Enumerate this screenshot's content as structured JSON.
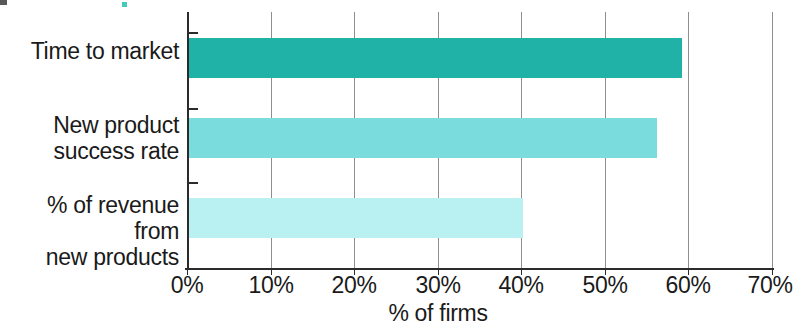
{
  "chart_data": {
    "type": "bar",
    "orientation": "horizontal",
    "title": "",
    "xlabel": "% of firms",
    "ylabel": "",
    "categories": [
      "Time to market",
      "New product\nsuccess rate",
      "% of revenue from\nnew products"
    ],
    "values": [
      59,
      56,
      40
    ],
    "xlim": [
      0,
      70
    ],
    "xticks": [
      0,
      10,
      20,
      30,
      40,
      50,
      60,
      70
    ],
    "xticklabels": [
      "0%",
      "10%",
      "20%",
      "30%",
      "40%",
      "50%",
      "60%",
      "70%"
    ],
    "grid": "vertical",
    "legend": "none",
    "bar_colors": [
      "#20b2a6",
      "#7adcdc",
      "#b9f0f2"
    ]
  },
  "axis": {
    "x_title": "% of firms",
    "tick_0": "0%",
    "tick_1": "10%",
    "tick_2": "20%",
    "tick_3": "30%",
    "tick_4": "40%",
    "tick_5": "50%",
    "tick_6": "60%",
    "tick_7": "70%"
  },
  "categories": {
    "cat_0": "Time to market",
    "cat_1": "New product\nsuccess rate",
    "cat_2": "% of revenue from\nnew products"
  },
  "colors": {
    "bar_1": "#20b2a6",
    "bar_2": "#7adcdc",
    "bar_3": "#b9f0f2",
    "axis": "#2b2b2b",
    "grid": "#8e8e8e",
    "text": "#1a1a1a",
    "background": "#ffffff"
  }
}
